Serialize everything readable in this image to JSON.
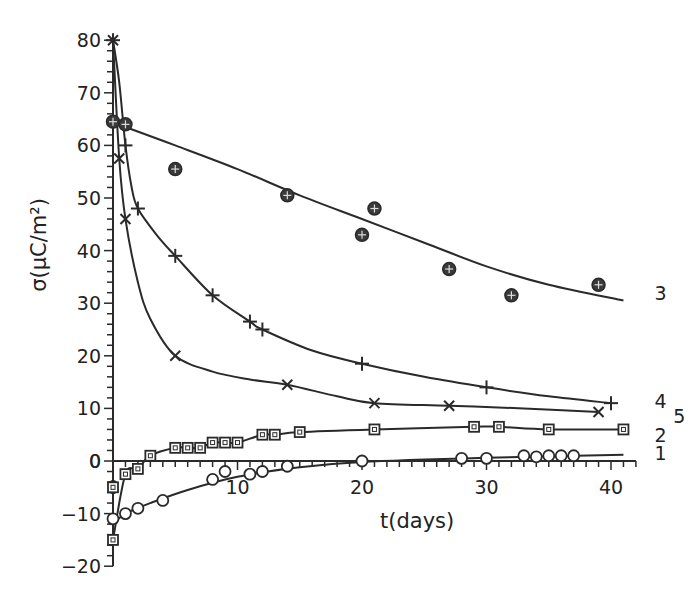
{
  "chart_data": {
    "type": "line",
    "title": "",
    "xlabel": "t(days)",
    "ylabel": "σ(μC/m²)",
    "xlim": [
      0,
      42
    ],
    "ylim": [
      -20,
      80
    ],
    "xticks": [
      10,
      20,
      30,
      40
    ],
    "yticks": [
      -20,
      -10,
      0,
      10,
      20,
      30,
      40,
      50,
      60,
      70,
      80
    ],
    "grid": false,
    "legend": "inline curve labels at right end",
    "series": [
      {
        "name": "1",
        "marker": "circle",
        "points": [
          [
            0,
            -11
          ],
          [
            1,
            -10
          ],
          [
            2,
            -9
          ],
          [
            4,
            -7.5
          ],
          [
            8,
            -3.5
          ],
          [
            9,
            -2
          ],
          [
            11,
            -2.5
          ],
          [
            12,
            -2
          ],
          [
            14,
            -1
          ],
          [
            20,
            0
          ],
          [
            28,
            0.5
          ],
          [
            30,
            0.5
          ],
          [
            33,
            1
          ],
          [
            34,
            0.8
          ],
          [
            35,
            1
          ],
          [
            36,
            1
          ],
          [
            37,
            1
          ]
        ],
        "fit": [
          [
            0,
            -12
          ],
          [
            1,
            -10
          ],
          [
            3,
            -8
          ],
          [
            6,
            -5.5
          ],
          [
            10,
            -3
          ],
          [
            15,
            -1.2
          ],
          [
            20,
            -0.2
          ],
          [
            30,
            0.6
          ],
          [
            41,
            1.2
          ]
        ]
      },
      {
        "name": "2",
        "marker": "square",
        "points": [
          [
            0,
            -15
          ],
          [
            0,
            -5
          ],
          [
            1,
            -2.5
          ],
          [
            2,
            -1.5
          ],
          [
            3,
            1
          ],
          [
            5,
            2.5
          ],
          [
            6,
            2.5
          ],
          [
            7,
            2.5
          ],
          [
            8,
            3.5
          ],
          [
            9,
            3.5
          ],
          [
            10,
            3.5
          ],
          [
            12,
            5
          ],
          [
            13,
            5
          ],
          [
            15,
            5.5
          ],
          [
            21,
            6
          ],
          [
            29,
            6.5
          ],
          [
            31,
            6.5
          ],
          [
            35,
            6
          ],
          [
            41,
            6
          ]
        ],
        "fit": [
          [
            0,
            -15
          ],
          [
            1,
            -2.5
          ],
          [
            2,
            -1.5
          ],
          [
            3,
            1
          ],
          [
            5,
            2.5
          ],
          [
            6,
            2.5
          ],
          [
            7,
            2.5
          ],
          [
            8,
            3.5
          ],
          [
            9,
            3.5
          ],
          [
            10,
            3.5
          ],
          [
            12,
            5
          ],
          [
            13,
            5
          ],
          [
            15,
            5.5
          ],
          [
            21,
            6
          ],
          [
            29,
            6.5
          ],
          [
            31,
            6.5
          ],
          [
            35,
            6
          ],
          [
            41,
            6
          ]
        ]
      },
      {
        "name": "3",
        "marker": "circle-plus",
        "points": [
          [
            0,
            64.5
          ],
          [
            1,
            64
          ],
          [
            5,
            55.5
          ],
          [
            14,
            50.5
          ],
          [
            20,
            43
          ],
          [
            21,
            48
          ],
          [
            27,
            36.5
          ],
          [
            32,
            31.5
          ],
          [
            39,
            33.5
          ]
        ],
        "fit": [
          [
            0,
            64.5
          ],
          [
            1,
            63.5
          ],
          [
            5,
            60
          ],
          [
            10,
            55.5
          ],
          [
            15,
            50.5
          ],
          [
            20,
            46
          ],
          [
            25,
            41.5
          ],
          [
            30,
            37
          ],
          [
            35,
            33.5
          ],
          [
            41,
            30.5
          ]
        ]
      },
      {
        "name": "4",
        "marker": "plus",
        "points": [
          [
            0,
            80
          ],
          [
            1,
            60
          ],
          [
            2,
            48
          ],
          [
            5,
            39
          ],
          [
            8,
            31.5
          ],
          [
            11,
            26.5
          ],
          [
            12,
            25
          ],
          [
            20,
            18.5
          ],
          [
            30,
            14
          ],
          [
            40,
            11
          ]
        ],
        "fit": [
          [
            0,
            80
          ],
          [
            0.5,
            72
          ],
          [
            1,
            60
          ],
          [
            1.5,
            52
          ],
          [
            2,
            48
          ],
          [
            3.5,
            43
          ],
          [
            5,
            39
          ],
          [
            8,
            31.5
          ],
          [
            11,
            26.5
          ],
          [
            12,
            25
          ],
          [
            16,
            21
          ],
          [
            20,
            18.5
          ],
          [
            25,
            16
          ],
          [
            30,
            14
          ],
          [
            35,
            12.3
          ],
          [
            40,
            11
          ]
        ]
      },
      {
        "name": "5",
        "marker": "x",
        "points": [
          [
            0,
            80
          ],
          [
            0.5,
            57.5
          ],
          [
            1,
            46
          ],
          [
            5,
            20
          ],
          [
            14,
            14.5
          ],
          [
            21,
            11
          ],
          [
            27,
            10.5
          ],
          [
            39,
            9.3
          ]
        ],
        "fit": [
          [
            0,
            80
          ],
          [
            0.5,
            57.5
          ],
          [
            1,
            46
          ],
          [
            2,
            34
          ],
          [
            3,
            27
          ],
          [
            5,
            20
          ],
          [
            8,
            17
          ],
          [
            11,
            15.5
          ],
          [
            14,
            14.5
          ],
          [
            18,
            12.3
          ],
          [
            21,
            11
          ],
          [
            27,
            10.5
          ],
          [
            33,
            10
          ],
          [
            39,
            9.3
          ]
        ]
      }
    ],
    "label_positions": {
      "1": {
        "x": 43.5,
        "y": 1.5
      },
      "2": {
        "x": 43.5,
        "y": 5
      },
      "3": {
        "x": 43.5,
        "y": 32
      },
      "4": {
        "x": 43.5,
        "y": 11.5
      },
      "5": {
        "x": 45,
        "y": 8.5
      }
    }
  }
}
